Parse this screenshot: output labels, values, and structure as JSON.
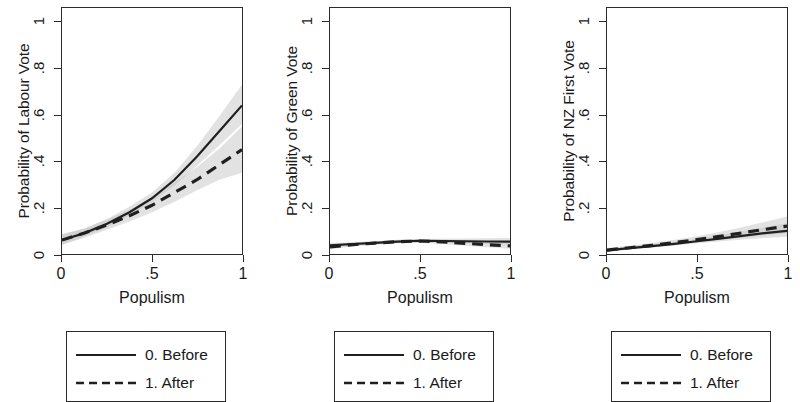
{
  "figure": {
    "background": "#ffffff",
    "line_color": "#1f1f1f",
    "band_color": "#bfbfbf",
    "axis_color": "#2b2b2b"
  },
  "xlabel": "Populism",
  "x_ticks": [
    "0",
    ".5",
    "1"
  ],
  "x_tick_values": [
    0,
    0.5,
    1
  ],
  "y_ticks": [
    "0",
    ".2",
    ".4",
    ".6",
    ".8",
    "1"
  ],
  "y_tick_values": [
    0,
    0.2,
    0.4,
    0.6,
    0.8,
    1
  ],
  "legend": {
    "items": [
      {
        "label": "0. Before",
        "style": "solid"
      },
      {
        "label": "1. After",
        "style": "dashed"
      }
    ]
  },
  "chart_data": [
    {
      "type": "line",
      "title": "",
      "xlabel": "Populism",
      "ylabel": "Probability of Labour Vote",
      "xlim": [
        0,
        1
      ],
      "ylim": [
        0,
        1.06
      ],
      "grid": false,
      "legend_position": "below-plot",
      "x": [
        0,
        0.125,
        0.25,
        0.375,
        0.5,
        0.625,
        0.75,
        0.875,
        1
      ],
      "series": [
        {
          "name": "0. Before",
          "style": "solid",
          "values": [
            0.06,
            0.09,
            0.13,
            0.18,
            0.24,
            0.32,
            0.42,
            0.53,
            0.64
          ],
          "ci_lower": [
            0.04,
            0.075,
            0.115,
            0.165,
            0.225,
            0.295,
            0.38,
            0.47,
            0.56
          ],
          "ci_upper": [
            0.085,
            0.11,
            0.15,
            0.205,
            0.265,
            0.35,
            0.465,
            0.595,
            0.73
          ]
        },
        {
          "name": "1. After",
          "style": "dashed",
          "values": [
            0.06,
            0.09,
            0.125,
            0.165,
            0.21,
            0.265,
            0.32,
            0.385,
            0.45
          ],
          "ci_lower": [
            0.04,
            0.07,
            0.105,
            0.14,
            0.18,
            0.225,
            0.275,
            0.32,
            0.35
          ],
          "ci_upper": [
            0.085,
            0.11,
            0.15,
            0.19,
            0.245,
            0.31,
            0.375,
            0.455,
            0.55
          ]
        }
      ]
    },
    {
      "type": "line",
      "title": "",
      "xlabel": "Populism",
      "ylabel": "Probability of Green Vote",
      "xlim": [
        0,
        1
      ],
      "ylim": [
        0,
        1.06
      ],
      "grid": false,
      "legend_position": "below-plot",
      "x": [
        0,
        0.125,
        0.25,
        0.375,
        0.5,
        0.625,
        0.75,
        0.875,
        1
      ],
      "series": [
        {
          "name": "0. Before",
          "style": "solid",
          "values": [
            0.037,
            0.043,
            0.048,
            0.053,
            0.057,
            0.056,
            0.055,
            0.054,
            0.053
          ],
          "ci_lower": [
            0.028,
            0.036,
            0.042,
            0.047,
            0.05,
            0.048,
            0.046,
            0.043,
            0.04
          ],
          "ci_upper": [
            0.048,
            0.051,
            0.055,
            0.06,
            0.065,
            0.066,
            0.067,
            0.068,
            0.069
          ]
        },
        {
          "name": "1. After",
          "style": "dashed",
          "values": [
            0.031,
            0.04,
            0.047,
            0.053,
            0.056,
            0.052,
            0.046,
            0.04,
            0.035
          ],
          "ci_lower": [
            0.022,
            0.032,
            0.04,
            0.046,
            0.048,
            0.043,
            0.036,
            0.029,
            0.023
          ],
          "ci_upper": [
            0.042,
            0.049,
            0.055,
            0.061,
            0.065,
            0.062,
            0.058,
            0.053,
            0.05
          ]
        }
      ]
    },
    {
      "type": "line",
      "title": "",
      "xlabel": "Populism",
      "ylabel": "Probability of NZ First Vote",
      "xlim": [
        0,
        1
      ],
      "ylim": [
        0,
        1.06
      ],
      "grid": false,
      "legend_position": "below-plot",
      "x": [
        0,
        0.125,
        0.25,
        0.375,
        0.5,
        0.625,
        0.75,
        0.875,
        1
      ],
      "series": [
        {
          "name": "0. Before",
          "style": "solid",
          "values": [
            0.016,
            0.025,
            0.034,
            0.044,
            0.055,
            0.066,
            0.078,
            0.09,
            0.1
          ],
          "ci_lower": [
            0.01,
            0.019,
            0.028,
            0.037,
            0.046,
            0.054,
            0.062,
            0.069,
            0.074
          ],
          "ci_upper": [
            0.024,
            0.033,
            0.042,
            0.053,
            0.066,
            0.081,
            0.098,
            0.115,
            0.132
          ]
        },
        {
          "name": "1. After",
          "style": "dashed",
          "values": [
            0.017,
            0.027,
            0.037,
            0.049,
            0.062,
            0.076,
            0.091,
            0.106,
            0.12
          ],
          "ci_lower": [
            0.01,
            0.019,
            0.029,
            0.039,
            0.05,
            0.06,
            0.07,
            0.08,
            0.088
          ],
          "ci_upper": [
            0.026,
            0.036,
            0.047,
            0.061,
            0.077,
            0.095,
            0.115,
            0.138,
            0.162
          ]
        }
      ]
    }
  ]
}
